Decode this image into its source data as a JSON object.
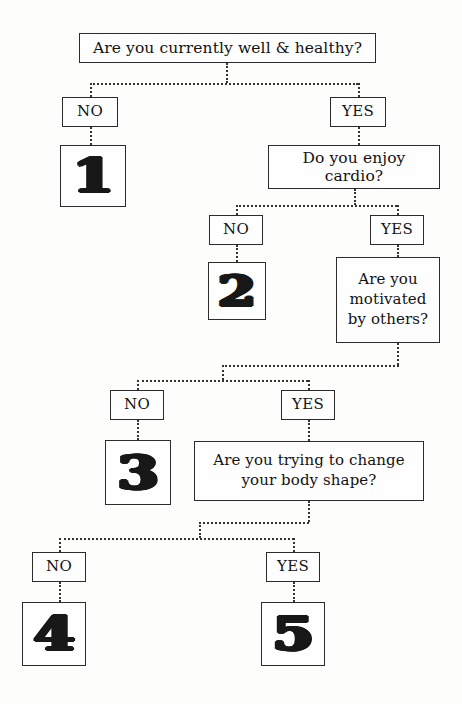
{
  "chart": {
    "type": "flowchart",
    "orientation": "top-down",
    "line_style": "dotted",
    "colors": {
      "background": "#fdfdfc",
      "box_border": "#2b2b2b",
      "text": "#121212",
      "connector": "#333333"
    }
  },
  "nodes": {
    "q1": {
      "id": "q1",
      "kind": "question",
      "text": "Are you currently well & healthy?"
    },
    "q1_no": {
      "id": "q1_no",
      "kind": "answer",
      "text": "NO"
    },
    "q1_yes": {
      "id": "q1_yes",
      "kind": "answer",
      "text": "YES"
    },
    "r1": {
      "id": "r1",
      "kind": "result",
      "text": "1"
    },
    "q2": {
      "id": "q2",
      "kind": "question",
      "text": "Do you enjoy cardio?"
    },
    "q2_no": {
      "id": "q2_no",
      "kind": "answer",
      "text": "NO"
    },
    "q2_yes": {
      "id": "q2_yes",
      "kind": "answer",
      "text": "YES"
    },
    "r2": {
      "id": "r2",
      "kind": "result",
      "text": "2"
    },
    "q3_line1": {
      "id": "q3_line1",
      "kind": "question",
      "text": "Are you"
    },
    "q3_line2": {
      "id": "q3_line2",
      "kind": "question",
      "text": "motivated"
    },
    "q3_line3": {
      "id": "q3_line3",
      "kind": "question",
      "text": "by others?"
    },
    "q3_no": {
      "id": "q3_no",
      "kind": "answer",
      "text": "NO"
    },
    "q3_yes": {
      "id": "q3_yes",
      "kind": "answer",
      "text": "YES"
    },
    "r3": {
      "id": "r3",
      "kind": "result",
      "text": "3"
    },
    "q4_line1": {
      "id": "q4_line1",
      "kind": "question",
      "text": "Are you trying to change"
    },
    "q4_line2": {
      "id": "q4_line2",
      "kind": "question",
      "text": "your body shape?"
    },
    "q4_no": {
      "id": "q4_no",
      "kind": "answer",
      "text": "NO"
    },
    "q4_yes": {
      "id": "q4_yes",
      "kind": "answer",
      "text": "YES"
    },
    "r4": {
      "id": "r4",
      "kind": "result",
      "text": "4"
    },
    "r5": {
      "id": "r5",
      "kind": "result",
      "text": "5"
    }
  },
  "edges": [
    {
      "from": "q1",
      "to": "q1_no",
      "label": "NO"
    },
    {
      "from": "q1",
      "to": "q1_yes",
      "label": "YES"
    },
    {
      "from": "q1_no",
      "to": "r1",
      "label": ""
    },
    {
      "from": "q1_yes",
      "to": "q2",
      "label": ""
    },
    {
      "from": "q2",
      "to": "q2_no",
      "label": "NO"
    },
    {
      "from": "q2",
      "to": "q2_yes",
      "label": "YES"
    },
    {
      "from": "q2_no",
      "to": "r2",
      "label": ""
    },
    {
      "from": "q2_yes",
      "to": "q3",
      "label": ""
    },
    {
      "from": "q3",
      "to": "q3_no",
      "label": "NO"
    },
    {
      "from": "q3",
      "to": "q3_yes",
      "label": "YES"
    },
    {
      "from": "q3_no",
      "to": "r3",
      "label": ""
    },
    {
      "from": "q3_yes",
      "to": "q4",
      "label": ""
    },
    {
      "from": "q4",
      "to": "q4_no",
      "label": "NO"
    },
    {
      "from": "q4",
      "to": "q4_yes",
      "label": "YES"
    },
    {
      "from": "q4_no",
      "to": "r4",
      "label": ""
    },
    {
      "from": "q4_yes",
      "to": "r5",
      "label": ""
    }
  ]
}
